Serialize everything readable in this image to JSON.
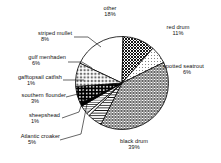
{
  "chart_data": {
    "type": "pie",
    "title": "",
    "units": "percent",
    "total": 100,
    "legend": "none (direct labels with leader lines)",
    "grid": false,
    "start_angle_deg": 0,
    "direction": "clockwise",
    "categories": [
      "other",
      "red drum",
      "spotted seatrout",
      "black drum",
      "Atlantic croaker",
      "sheepshead",
      "southern flounder",
      "gafftopsail catfish",
      "gulf menhaden",
      "striped mullet"
    ],
    "values": [
      18,
      11,
      6,
      39,
      5,
      1,
      3,
      1,
      6,
      8
    ],
    "slices": [
      {
        "label": "other",
        "percent_text": "18%",
        "value": 18,
        "fill": "white",
        "color": "#ffffff"
      },
      {
        "label": "red drum",
        "percent_text": "11%",
        "value": 11,
        "fill": "crosshatch",
        "color": "#8a8a8a"
      },
      {
        "label": "spotted seatrout",
        "percent_text": "6%",
        "value": 6,
        "fill": "fine-dots",
        "color": "#d8d8d8"
      },
      {
        "label": "black drum",
        "percent_text": "39%",
        "value": 39,
        "fill": "diag-mesh",
        "color": "#b4b4b4"
      },
      {
        "label": "Atlantic croaker",
        "percent_text": "5%",
        "value": 5,
        "fill": "h-lines",
        "color": "#c8c8c8"
      },
      {
        "label": "sheepshead",
        "percent_text": "1%",
        "value": 1,
        "fill": "white",
        "color": "#ffffff"
      },
      {
        "label": "southern flounder",
        "percent_text": "3%",
        "value": 3,
        "fill": "thin-stripes",
        "color": "#e0e0e0"
      },
      {
        "label": "gafftopsail catfish",
        "percent_text": "1%",
        "value": 1,
        "fill": "solid-black",
        "color": "#000000"
      },
      {
        "label": "gulf menhaden",
        "percent_text": "6%",
        "value": 6,
        "fill": "bold-dots",
        "color": "#303030"
      },
      {
        "label": "striped mullet",
        "percent_text": "8%",
        "value": 8,
        "fill": "open-dots",
        "color": "#eeeeee"
      }
    ]
  },
  "labels": {
    "other": {
      "name": "other",
      "pct": "18%"
    },
    "red_drum": {
      "name": "red drum",
      "pct": "11%"
    },
    "spotted_seatrout": {
      "name": "spotted seatrout",
      "pct": "6%"
    },
    "black_drum": {
      "name": "black drum",
      "pct": "39%"
    },
    "atlantic_croaker": {
      "name": "Atlantic croaker",
      "pct": "5%"
    },
    "sheepshead": {
      "name": "sheepshead",
      "pct": "1%"
    },
    "southern_flounder": {
      "name": "southern flounder",
      "pct": "3%"
    },
    "gafftopsail_catfish": {
      "name": "gafftopsail catfish",
      "pct": "1%"
    },
    "gulf_menhaden": {
      "name": "gulf menhaden",
      "pct": "6%"
    },
    "striped_mullet": {
      "name": "striped mullet",
      "pct": "8%"
    }
  }
}
